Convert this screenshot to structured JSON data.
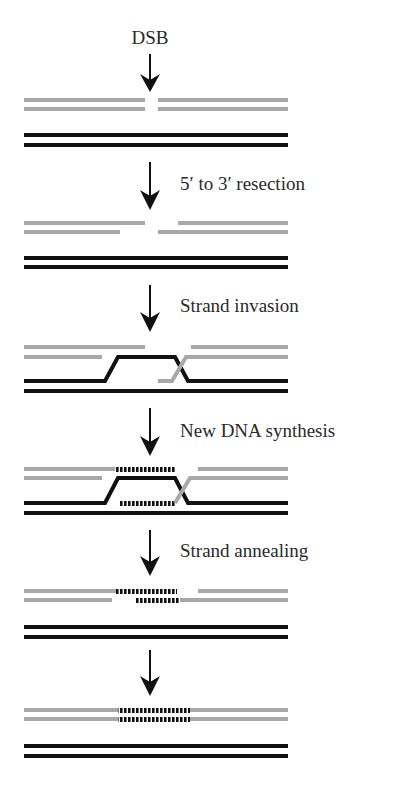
{
  "colors": {
    "broken_strand": "#a8a8a8",
    "template_strand": "#111111",
    "new_synthesis": "#111111",
    "arrow": "#111111",
    "text": "#2a2a2a",
    "background": "#ffffff"
  },
  "steps": [
    {
      "id": "dsb",
      "label": "DSB",
      "label_position": "above-arrow"
    },
    {
      "id": "resection",
      "label": "5′ to 3′ resection",
      "label_position": "right-of-arrow"
    },
    {
      "id": "invasion",
      "label": "Strand invasion",
      "label_position": "right-of-arrow"
    },
    {
      "id": "synthesis",
      "label": "New DNA synthesis",
      "label_position": "right-of-arrow"
    },
    {
      "id": "annealing",
      "label": "Strand annealing",
      "label_position": "right-of-arrow"
    },
    {
      "id": "final",
      "label": "",
      "label_position": "none"
    }
  ],
  "legend": {
    "grey_strands": "broken duplex",
    "black_strands": "homologous template duplex",
    "dashed_black": "newly synthesized DNA"
  }
}
